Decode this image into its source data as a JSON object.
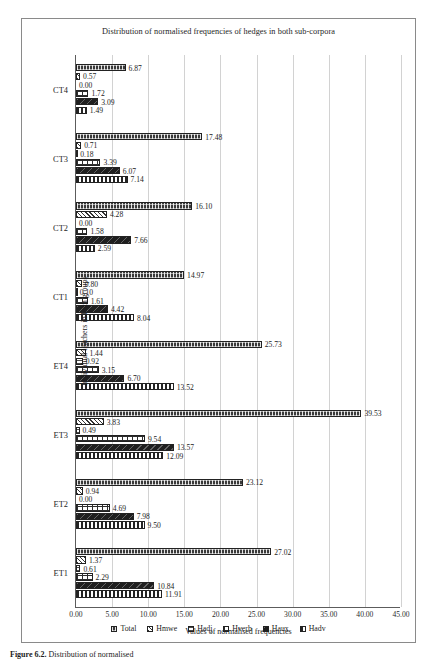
{
  "figure": {
    "title": "Distribution of normalised frequencies of hedges in both sub-corpora",
    "caption_label": "Figure 6.2.",
    "caption_text": "Distribution of normalised"
  },
  "axes": {
    "x_title": "Values of normalised frequencies",
    "y_title": "Individual teachers in both groups",
    "x_ticks": [
      "0.00",
      "5.00",
      "10.00",
      "15.00",
      "20.00",
      "25.00",
      "30.00",
      "35.00",
      "40.00",
      "45.00"
    ]
  },
  "legend": {
    "items": [
      {
        "label": "Total",
        "key": "total",
        "swatch": "pattern-total"
      },
      {
        "label": "Hmwe",
        "key": "hmwe",
        "swatch": "pattern-hmwe"
      },
      {
        "label": "Hadj",
        "key": "hadj",
        "swatch": "pattern-hadj"
      },
      {
        "label": "Hverb",
        "key": "hverb",
        "swatch": "pattern-hverb"
      },
      {
        "label": "Haux",
        "key": "haux",
        "swatch": "pattern-haux"
      },
      {
        "label": "Hadv",
        "key": "hadv",
        "swatch": "pattern-hadv"
      }
    ]
  },
  "chart_data": {
    "type": "bar",
    "orientation": "horizontal",
    "title": "Distribution of normalised frequencies of hedges in both sub-corpora",
    "xlabel": "Values of normalised frequencies",
    "ylabel": "Individual teachers in both groups",
    "xlim": [
      0,
      45
    ],
    "xtick_step": 5,
    "grid": true,
    "legend_position": "bottom",
    "categories": [
      "CT4",
      "CT3",
      "CT2",
      "CT1",
      "ET4",
      "ET3",
      "ET2",
      "ET1"
    ],
    "series": [
      {
        "name": "Total",
        "values": [
          6.87,
          17.48,
          16.1,
          14.97,
          25.73,
          39.53,
          23.12,
          27.02
        ]
      },
      {
        "name": "Hmwe",
        "values": [
          0.57,
          0.71,
          4.28,
          0.8,
          1.44,
          3.83,
          0.94,
          1.37
        ]
      },
      {
        "name": "Hadj",
        "values": [
          0.0,
          0.18,
          0.0,
          0.1,
          0.92,
          0.49,
          0.0,
          0.61
        ]
      },
      {
        "name": "Hverb",
        "values": [
          1.72,
          3.39,
          1.58,
          1.61,
          3.15,
          9.54,
          4.69,
          2.29
        ]
      },
      {
        "name": "Haux",
        "values": [
          3.09,
          6.07,
          7.66,
          4.42,
          6.7,
          13.57,
          7.98,
          10.84
        ]
      },
      {
        "name": "Hadv",
        "values": [
          1.49,
          7.14,
          2.59,
          8.04,
          13.52,
          12.09,
          9.5,
          11.91
        ]
      }
    ],
    "value_labels": {
      "CT4": [
        "6.87",
        "0.57",
        "0.00",
        "1.72",
        "3.09",
        "1.49"
      ],
      "CT3": [
        "17.48",
        "0.71",
        "0.18",
        "3.39",
        "6.07",
        "7.14"
      ],
      "CT2": [
        "16.10",
        "4.28",
        "0.00",
        "1.58",
        "7.66",
        "2.59"
      ],
      "CT1": [
        "14.97",
        "0.80",
        "0.10",
        "1.61",
        "4.42",
        "8.04"
      ],
      "ET4": [
        "25.73",
        "1.44",
        "0.92",
        "3.15",
        "6.70",
        "13.52"
      ],
      "ET3": [
        "39.53",
        "3.83",
        "0.49",
        "9.54",
        "13.57",
        "12.09"
      ],
      "ET2": [
        "23.12",
        "0.94",
        "0.00",
        "4.69",
        "7.98",
        "9.50"
      ],
      "ET1": [
        "27.02",
        "1.37",
        "0.61",
        "2.29",
        "10.84",
        "11.91"
      ]
    }
  }
}
